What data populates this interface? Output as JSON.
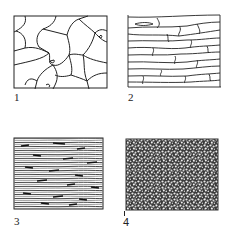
{
  "figure": {
    "panels": [
      {
        "id": "1",
        "label": "1",
        "description": "equiaxed polygonal grains"
      },
      {
        "id": "2",
        "label": "2",
        "description": "elongated grains"
      },
      {
        "id": "3",
        "label": "3",
        "description": "highly elongated fibrous grains"
      },
      {
        "id": "4",
        "label": "4",
        "description": "fine recrystallized grains"
      }
    ],
    "colors": {
      "line": "#222222",
      "background": "#ffffff"
    }
  }
}
